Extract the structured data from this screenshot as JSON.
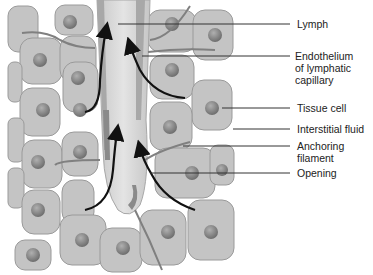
{
  "diagram": {
    "labels": [
      {
        "id": "lymph",
        "lines": [
          "Lymph"
        ]
      },
      {
        "id": "endothelium",
        "lines": [
          "Endothelium",
          "of lymphatic",
          "capillary"
        ]
      },
      {
        "id": "tissue-cell",
        "lines": [
          "Tissue cell"
        ]
      },
      {
        "id": "interstitial-fluid",
        "lines": [
          "Interstitial fluid"
        ]
      },
      {
        "id": "anchoring-filament",
        "lines": [
          "Anchoring",
          "filament"
        ]
      },
      {
        "id": "opening",
        "lines": [
          "Opening"
        ]
      }
    ],
    "colors": {
      "cell_fill": "#c4c4c4",
      "cell_edge": "#9a9a9a",
      "nucleus": "#7e7e7e",
      "vessel": "#d6d6d6",
      "vessel_wall": "#a8a8a8",
      "filament": "#808080",
      "arrow": "#111111",
      "leader": "#333333"
    }
  }
}
